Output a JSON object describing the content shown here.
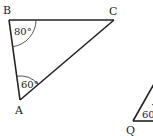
{
  "diagram": {
    "type": "geometry",
    "triangle_abc": {
      "vertices": {
        "A": {
          "label": "A",
          "x": 20,
          "y": 100
        },
        "B": {
          "label": "B",
          "x": 9,
          "y": 20
        },
        "C": {
          "label": "C",
          "x": 114,
          "y": 20
        }
      },
      "angles": {
        "B": {
          "label": "80°"
        },
        "A": {
          "label": "60°"
        }
      }
    },
    "triangle_partial": {
      "vertices": {
        "Q": {
          "label": "Q",
          "x": 133,
          "y": 121
        }
      },
      "angles": {
        "Q": {
          "label": "60"
        }
      }
    },
    "line_color": "#222222",
    "background": "#ffffff"
  }
}
